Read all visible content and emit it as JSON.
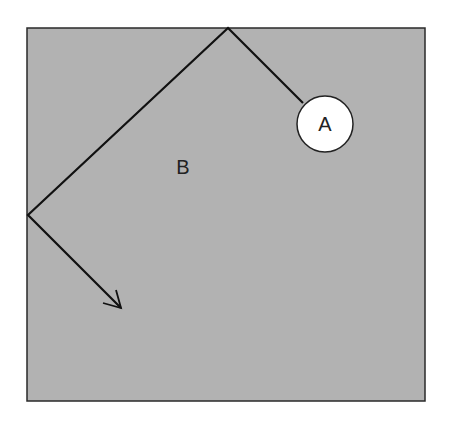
{
  "diagram": {
    "box": {
      "x": 27,
      "y": 28,
      "width": 398,
      "height": 373,
      "fill": "#b2b2b2",
      "stroke": "#2a2a2a"
    },
    "path_points": [
      [
        303,
        103
      ],
      [
        228,
        28
      ],
      [
        28,
        215
      ],
      [
        121,
        308
      ]
    ],
    "circle": {
      "cx": 325,
      "cy": 124,
      "r": 28,
      "fill": "#ffffff",
      "stroke": "#222222"
    },
    "labels": {
      "circle_label": "A",
      "region_label": "B"
    },
    "line_color": "#111111",
    "arrow_tip": [
      121,
      308
    ]
  }
}
